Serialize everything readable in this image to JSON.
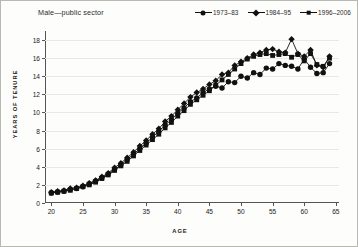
{
  "chart_data": {
    "type": "line",
    "title": "Male—public sector",
    "xlabel": "AGE",
    "ylabel": "YEARS OF TENURE",
    "xlim": [
      19,
      65.5
    ],
    "ylim": [
      0,
      19
    ],
    "grid": true,
    "legend_position": "top-right",
    "xticks": [
      20,
      25,
      30,
      35,
      40,
      45,
      50,
      55,
      60,
      65
    ],
    "yticks": [
      0,
      2,
      4,
      6,
      8,
      10,
      12,
      14,
      16,
      18
    ],
    "x": [
      20,
      21,
      22,
      23,
      24,
      25,
      26,
      27,
      28,
      29,
      30,
      31,
      32,
      33,
      34,
      35,
      36,
      37,
      38,
      39,
      40,
      41,
      42,
      43,
      44,
      45,
      46,
      47,
      48,
      49,
      50,
      51,
      52,
      53,
      54,
      55,
      56,
      57,
      58,
      59,
      60,
      61,
      62,
      63,
      64
    ],
    "series": [
      {
        "name": "1973–83",
        "marker": "circle",
        "values": [
          1.1,
          1.2,
          1.3,
          1.5,
          1.6,
          1.8,
          2.1,
          2.4,
          2.8,
          3.2,
          3.7,
          4.2,
          4.8,
          5.4,
          6.0,
          6.6,
          7.3,
          7.9,
          8.6,
          9.2,
          9.9,
          10.5,
          11.2,
          11.6,
          12.2,
          12.6,
          12.9,
          12.7,
          13.4,
          13.3,
          14.0,
          13.8,
          14.4,
          14.2,
          14.9,
          14.8,
          15.4,
          15.2,
          15.1,
          14.8,
          15.9,
          15.0,
          14.3,
          14.4,
          15.4
        ]
      },
      {
        "name": "1984–95",
        "marker": "diamond",
        "values": [
          1.2,
          1.3,
          1.4,
          1.6,
          1.7,
          1.9,
          2.2,
          2.5,
          2.9,
          3.3,
          3.9,
          4.4,
          5.0,
          5.6,
          6.3,
          6.9,
          7.6,
          8.2,
          9.0,
          9.6,
          10.3,
          11.0,
          11.7,
          12.2,
          12.6,
          13.1,
          13.5,
          14.2,
          14.4,
          15.2,
          15.6,
          16.0,
          16.4,
          16.6,
          16.9,
          17.0,
          16.7,
          16.6,
          18.1,
          16.5,
          16.2,
          16.9,
          15.2,
          15.0,
          16.2
        ]
      },
      {
        "name": "1996–2006",
        "marker": "square",
        "values": [
          1.1,
          1.2,
          1.3,
          1.4,
          1.6,
          1.8,
          2.0,
          2.3,
          2.7,
          3.1,
          3.6,
          4.1,
          4.6,
          5.2,
          5.8,
          6.4,
          7.0,
          7.6,
          8.3,
          8.9,
          9.6,
          10.2,
          10.9,
          11.4,
          11.9,
          12.4,
          13.0,
          13.6,
          14.2,
          14.8,
          15.4,
          15.9,
          16.2,
          16.4,
          16.5,
          16.3,
          16.4,
          16.5,
          16.1,
          16.4,
          15.7,
          16.5,
          15.3,
          15.1,
          16.0
        ]
      }
    ]
  }
}
